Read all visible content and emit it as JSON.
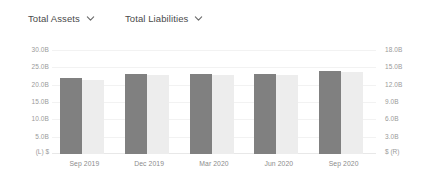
{
  "toolbar": {
    "selectors": [
      {
        "label": "Total Assets",
        "icon": "chevron-down-icon"
      },
      {
        "label": "Total Liabilities",
        "icon": "chevron-down-icon"
      }
    ]
  },
  "chart_data": {
    "type": "bar",
    "title": "",
    "subtitle": "",
    "xlabel": "",
    "ylabel": "",
    "grid": true,
    "legend_position": "top",
    "categories": [
      "Sep 2019",
      "Dec 2019",
      "Mar 2020",
      "Jun 2020",
      "Sep 2020"
    ],
    "series": [
      {
        "name": "Total Assets",
        "axis": "left",
        "color": "#808080",
        "values": [
          21.8,
          23.0,
          23.0,
          23.0,
          23.8
        ]
      },
      {
        "name": "Total Liabilities",
        "axis": "right",
        "color": "#ededed",
        "values": [
          12.8,
          13.6,
          13.6,
          13.6,
          14.1
        ]
      }
    ],
    "left_axis": {
      "corner_label": "(L) $",
      "unit": "B",
      "ticks": [
        "30.0B",
        "25.0B",
        "20.0B",
        "15.0B",
        "10.0B",
        "5.0B"
      ],
      "tick_values": [
        30,
        25,
        20,
        15,
        10,
        5
      ],
      "ylim": [
        0,
        34
      ]
    },
    "right_axis": {
      "corner_label": "$ (R)",
      "unit": "B",
      "ticks": [
        "18.0B",
        "15.0B",
        "12.0B",
        "9.0B",
        "6.0B",
        "3.0B"
      ],
      "tick_values": [
        18,
        15,
        12,
        9,
        6,
        3
      ],
      "ylim": [
        0,
        20.4
      ]
    }
  }
}
